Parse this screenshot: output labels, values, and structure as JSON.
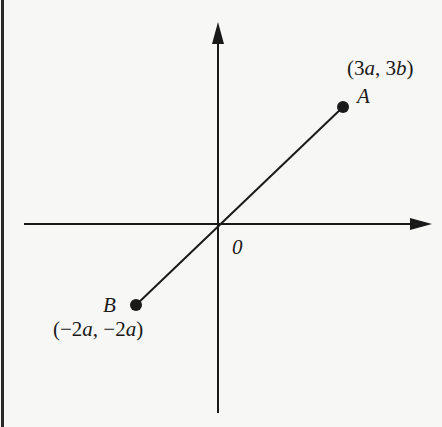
{
  "diagram": {
    "type": "coordinate-plane",
    "origin_label": "0",
    "points": [
      {
        "name": "A",
        "coords": "(3a, 3b)",
        "coords_parts": [
          "(3",
          "a",
          ", 3",
          "b",
          ")"
        ]
      },
      {
        "name": "B",
        "coords": "(−2a, −2a)",
        "coords_parts": [
          "(−2",
          "a",
          ", −2",
          "a",
          ")"
        ]
      }
    ],
    "segment": "AB",
    "colors": {
      "ink": "#1a1a1a",
      "paper": "#f7f7f5"
    }
  }
}
